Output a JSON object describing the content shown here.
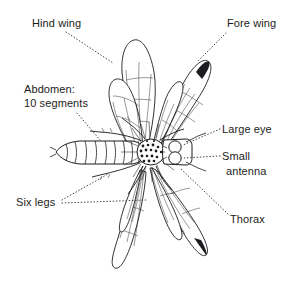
{
  "figure": {
    "view": "dorsal",
    "background_color": "#ffffff",
    "ink_color": "#1c1c20",
    "leader_line_style": "dotted",
    "labels": [
      {
        "id": "hind-wing",
        "text": "Hind wing",
        "x": 32,
        "y": 18,
        "align": "left"
      },
      {
        "id": "fore-wing",
        "text": "Fore wing",
        "x": 227,
        "y": 18,
        "align": "left"
      },
      {
        "id": "abdomen",
        "line1": "Abdomen:",
        "line2": "10 segments",
        "text": "Abdomen: 10 segments",
        "x": 24,
        "y": 84,
        "align": "left"
      },
      {
        "id": "large-eye",
        "text": "Large eye",
        "x": 222,
        "y": 124,
        "align": "left"
      },
      {
        "id": "small-antenna",
        "line1": "Small",
        "line2": "antenna",
        "text": "Small antenna",
        "x": 222,
        "y": 151,
        "align": "left"
      },
      {
        "id": "six-legs",
        "text": "Six legs",
        "x": 16,
        "y": 197,
        "align": "left"
      },
      {
        "id": "thorax",
        "text": "Thorax",
        "x": 230,
        "y": 214,
        "align": "left"
      }
    ],
    "anatomy_parts": [
      "hind wing",
      "fore wing",
      "abdomen",
      "large eye",
      "small antenna",
      "six legs",
      "thorax"
    ],
    "abdomen_segment_count": 10
  }
}
